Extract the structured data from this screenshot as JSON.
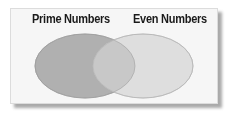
{
  "diagram": {
    "type": "venn",
    "sets": [
      {
        "label": "Prime Numbers",
        "fill": "#b0b0b0",
        "stroke": "#9a9a9a"
      },
      {
        "label": "Even Numbers",
        "fill": "#dddddd",
        "stroke": "#b8b8b8"
      }
    ],
    "intersection_fill": "#c6c6c6"
  }
}
